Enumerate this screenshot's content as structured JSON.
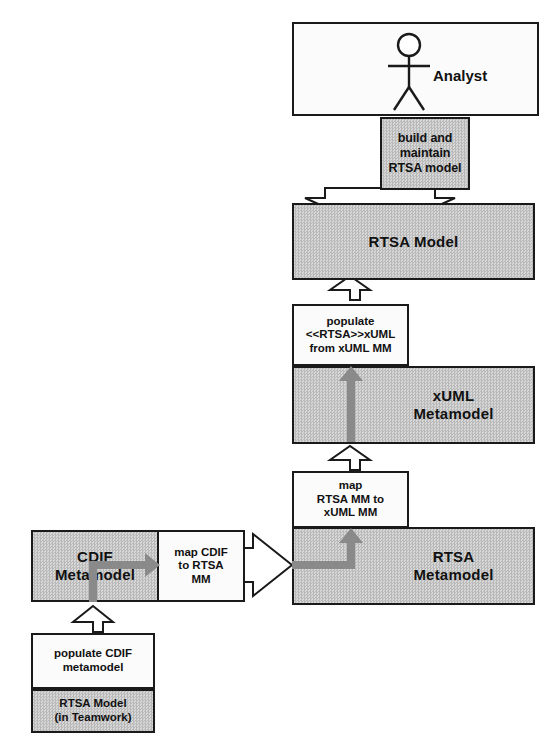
{
  "diagram": {
    "colors": {
      "gray_fill": "#c8c8c8",
      "white_fill": "#fbfbfb",
      "stroke": "#1a1a1a",
      "gray_arrow": "#8a8a8a"
    }
  },
  "nodes": {
    "analyst_actor": {
      "label": "Analyst",
      "icon": "stick-figure-actor-icon"
    },
    "build_maintain": {
      "line1": "build and maintain",
      "line2": "RTSA model"
    },
    "rtsa_model": {
      "label": "RTSA Model"
    },
    "populate_xuml": {
      "line1": "populate",
      "line2": "<<RTSA>>xUML",
      "line3": "from xUML MM"
    },
    "xuml_metamodel": {
      "line1": "xUML",
      "line2": "Metamodel"
    },
    "map_rtsa_to_xuml": {
      "line1": "map",
      "line2": "RTSA MM to",
      "line3": "xUML MM"
    },
    "rtsa_metamodel": {
      "line1": "RTSA",
      "line2": "Metamodel"
    },
    "cdif_metamodel": {
      "line1": "CDIF",
      "line2": "Metamodel"
    },
    "map_cdif_to_rtsa": {
      "line1": "map CDIF",
      "line2": "to RTSA",
      "line3": "MM"
    },
    "populate_cdif": {
      "line1": "populate CDIF",
      "line2": "metamodel"
    },
    "rtsa_model_teamwork": {
      "line1": "RTSA Model",
      "line2": "(in Teamwork)"
    }
  },
  "arrows": {
    "build_to_rtsa_model": {
      "name": "hollow-arrow-down",
      "direction": "down"
    },
    "populate_to_rtsa_model": {
      "name": "hollow-arrow-up",
      "direction": "up"
    },
    "map_to_xuml_metamodel": {
      "name": "hollow-arrow-up",
      "direction": "up"
    },
    "populate_cdif_to_cdif": {
      "name": "hollow-arrow-up",
      "direction": "up"
    },
    "mapcdif_to_rtsa_metamodel": {
      "name": "hollow-arrow-right",
      "direction": "right"
    },
    "xuml_internal_flow": {
      "name": "gray-arrow-up",
      "direction": "up"
    },
    "rtsa_mm_internal_flow": {
      "name": "gray-arrow-elbow-up",
      "direction": "right-then-up"
    },
    "cdif_internal_flow": {
      "name": "gray-arrow-elbow-right",
      "direction": "up-then-right"
    }
  }
}
